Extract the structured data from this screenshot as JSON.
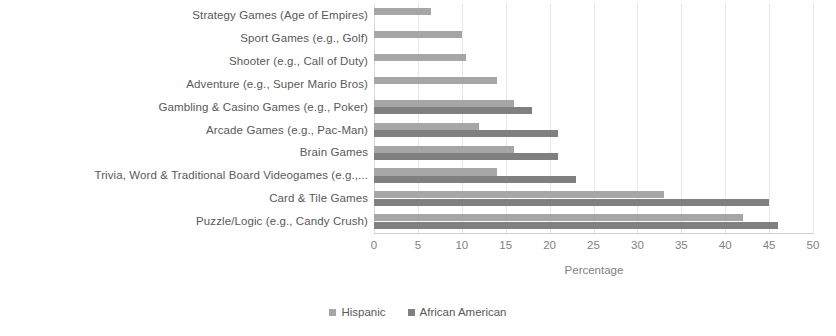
{
  "chart_data": {
    "type": "bar",
    "orientation": "horizontal",
    "title": "",
    "xlabel": "Percentage",
    "ylabel": "",
    "xlim": [
      0,
      50
    ],
    "xticks": [
      0,
      5,
      10,
      15,
      20,
      25,
      30,
      35,
      40,
      45,
      50
    ],
    "grid": true,
    "legend_position": "bottom",
    "categories": [
      "Strategy Games (Age of Empires)",
      "Sport Games (e.g., Golf)",
      "Shooter (e.g., Call of Duty)",
      "Adventure (e.g., Super Mario Bros)",
      "Gambling & Casino Games (e.g., Poker)",
      "Arcade Games (e.g., Pac-Man)",
      "Brain Games",
      "Trivia, Word & Traditional Board Videogames (e.g.,...",
      "Card & Tile Games",
      "Puzzle/Logic (e.g., Candy Crush)"
    ],
    "series": [
      {
        "name": "Hispanic",
        "color": "#a6a6a6",
        "values": [
          6.5,
          10,
          10.5,
          14,
          16,
          12,
          16,
          14,
          33,
          42
        ]
      },
      {
        "name": "African American",
        "color": "#808080",
        "values": [
          0,
          0,
          0,
          0,
          18,
          21,
          21,
          23,
          45,
          46
        ]
      }
    ]
  },
  "legend": {
    "items": [
      {
        "label": "Hispanic",
        "color": "#a6a6a6"
      },
      {
        "label": "African American",
        "color": "#808080"
      }
    ]
  },
  "axis": {
    "x_title": "Percentage"
  }
}
